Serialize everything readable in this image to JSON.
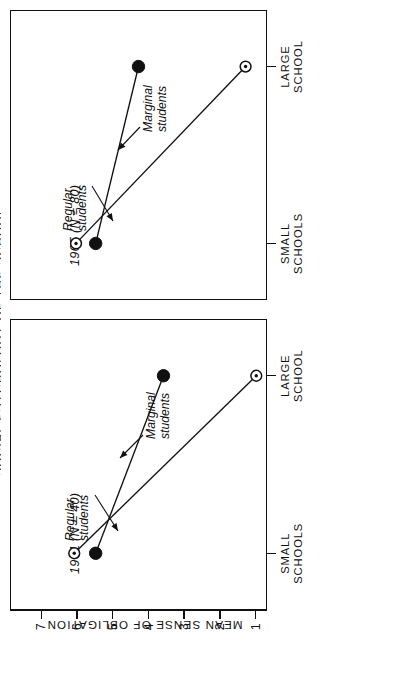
{
  "figure": {
    "clipped_running_title": "SOCIAL PSYCHOLOGY OF THE SCHOOL",
    "value_axis_title": "MEAN SENSE OF OBLIGATION",
    "value_ticks": [
      "7",
      "6",
      "5",
      "4",
      "3",
      "2",
      "1"
    ],
    "category_labels": [
      {
        "line1": "SMALL",
        "line2": "SCHOOLS"
      },
      {
        "line1": "LARGE",
        "line2": "SCHOOL"
      }
    ],
    "panels": [
      {
        "key": "p1961",
        "caption": "1961 (N = 40)"
      },
      {
        "key": "p1965",
        "caption": "1965 (N = 80)"
      }
    ],
    "series_notes": {
      "regular_line1": "Regular",
      "regular_line2": "students",
      "marginal_line1": "Marginal",
      "marginal_line2": "students"
    },
    "marker_legend": {
      "regular_marker": "filled-circle",
      "marginal_marker": "open-circle-with-dot"
    },
    "ink_color": "#111111",
    "paper_color": "#ffffff"
  },
  "chart_data": {
    "type": "line",
    "xlabel": "",
    "ylabel": "MEAN SENSE OF OBLIGATION",
    "categories": [
      "SMALL SCHOOLS",
      "LARGE SCHOOL"
    ],
    "ylim": [
      0.4,
      7.6
    ],
    "yticks": [
      7,
      6,
      5,
      4,
      3,
      2,
      1
    ],
    "grid": false,
    "legend": "inline-annotations",
    "panels": [
      {
        "name": "1961 (N = 40)",
        "series": [
          {
            "name": "Regular students",
            "marker": "filled-circle",
            "values": [
              5.2,
              3.3
            ]
          },
          {
            "name": "Marginal students",
            "marker": "open-circle-with-dot",
            "values": [
              5.8,
              0.7
            ]
          }
        ]
      },
      {
        "name": "1965 (N = 80)",
        "series": [
          {
            "name": "Regular students",
            "marker": "filled-circle",
            "values": [
              5.2,
              4.0
            ]
          },
          {
            "name": "Marginal students",
            "marker": "open-circle-with-dot",
            "values": [
              5.75,
              1.0
            ]
          }
        ]
      }
    ]
  }
}
